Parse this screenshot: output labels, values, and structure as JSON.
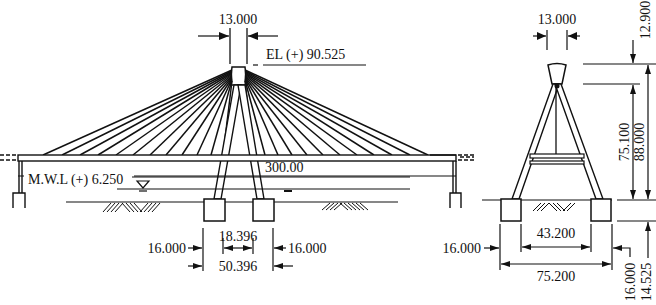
{
  "elevation": {
    "tower_top_width": "13.000",
    "tower_top_elevation": "EL (+) 90.525",
    "span_length": "300.00",
    "water_level": "M.W.L (+) 6.250",
    "pier_spacing_inner": "18.396",
    "pier_spacing_outer": "50.396",
    "footing_left_width": "16.000",
    "footing_right_width": "16.000",
    "cables_per_side": 12
  },
  "cross_section": {
    "tower_top_width": "13.000",
    "top_segment_height": "12.900",
    "legs_height": "75.100",
    "total_height": "88.000",
    "inner_footing_spacing": "43.200",
    "outer_footing_spacing": "75.200",
    "footing_width": "16.000",
    "footing_depth": "16.000",
    "foundation_depth": "14.525"
  },
  "colors": {
    "line": "#111111",
    "background": "#ffffff"
  }
}
